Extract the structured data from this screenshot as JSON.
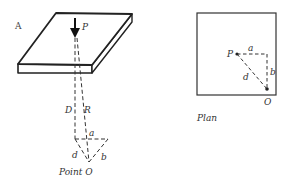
{
  "figure": {
    "panel_label": "A",
    "perspective_view": {
      "load_label": "P",
      "vertical_distance_label": "D",
      "slant_distance_label": "R",
      "horizontal_offset_a": "a",
      "horizontal_offset_b": "b",
      "horizontal_distance_d": "d",
      "point_label": "Point O"
    },
    "plan_view": {
      "title": "Plan",
      "load_label": "P",
      "offset_a": "a",
      "offset_b": "b",
      "distance_d": "d",
      "point_label": "O"
    }
  }
}
